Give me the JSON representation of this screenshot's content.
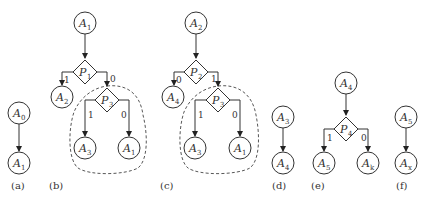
{
  "figure": {
    "panels": [
      {
        "caption": "(a)",
        "nodes": [
          {
            "id": "a_n1",
            "type": "action",
            "base": "A",
            "sub": "0"
          },
          {
            "id": "a_n2",
            "type": "action",
            "base": "A",
            "sub": "1"
          }
        ],
        "edges": [
          {
            "from": "a_n1",
            "to": "a_n2",
            "label": ""
          }
        ]
      },
      {
        "caption": "(b)",
        "nodes": [
          {
            "id": "b_n1",
            "type": "action",
            "base": "A",
            "sub": "1"
          },
          {
            "id": "b_p1",
            "type": "predicate",
            "base": "P",
            "sub": "1"
          },
          {
            "id": "b_n2",
            "type": "action",
            "base": "A",
            "sub": "2"
          },
          {
            "id": "b_p3",
            "type": "predicate",
            "base": "P",
            "sub": "3"
          },
          {
            "id": "b_n3",
            "type": "action",
            "base": "A",
            "sub": "3"
          },
          {
            "id": "b_n4",
            "type": "action",
            "base": "A",
            "sub": "1"
          }
        ],
        "edges": [
          {
            "from": "b_n1",
            "to": "b_p1",
            "label": ""
          },
          {
            "from": "b_p1",
            "to": "b_n2",
            "label": "1"
          },
          {
            "from": "b_p1",
            "to": "b_p3",
            "label": "0"
          },
          {
            "from": "b_p3",
            "to": "b_n3",
            "label": "1"
          },
          {
            "from": "b_p3",
            "to": "b_n4",
            "label": "0"
          }
        ],
        "highlight": "dashed region around P3 subtree"
      },
      {
        "caption": "(c)",
        "nodes": [
          {
            "id": "c_n1",
            "type": "action",
            "base": "A",
            "sub": "2"
          },
          {
            "id": "c_p2",
            "type": "predicate",
            "base": "P",
            "sub": "2"
          },
          {
            "id": "c_n2",
            "type": "action",
            "base": "A",
            "sub": "4"
          },
          {
            "id": "c_p3",
            "type": "predicate",
            "base": "P",
            "sub": "3"
          },
          {
            "id": "c_n3",
            "type": "action",
            "base": "A",
            "sub": "3"
          },
          {
            "id": "c_n4",
            "type": "action",
            "base": "A",
            "sub": "1"
          }
        ],
        "edges": [
          {
            "from": "c_n1",
            "to": "c_p2",
            "label": ""
          },
          {
            "from": "c_p2",
            "to": "c_n2",
            "label": "0"
          },
          {
            "from": "c_p2",
            "to": "c_p3",
            "label": "1"
          },
          {
            "from": "c_p3",
            "to": "c_n3",
            "label": "1"
          },
          {
            "from": "c_p3",
            "to": "c_n4",
            "label": "0"
          }
        ],
        "highlight": "dashed region around P3 subtree"
      },
      {
        "caption": "(d)",
        "nodes": [
          {
            "id": "d_n1",
            "type": "action",
            "base": "A",
            "sub": "3"
          },
          {
            "id": "d_n2",
            "type": "action",
            "base": "A",
            "sub": "4"
          }
        ],
        "edges": [
          {
            "from": "d_n1",
            "to": "d_n2",
            "label": ""
          }
        ]
      },
      {
        "caption": "(e)",
        "nodes": [
          {
            "id": "e_n1",
            "type": "action",
            "base": "A",
            "sub": "4"
          },
          {
            "id": "e_p4",
            "type": "predicate",
            "base": "P",
            "sub": "4"
          },
          {
            "id": "e_n2",
            "type": "action",
            "base": "A",
            "sub": "5"
          },
          {
            "id": "e_n3",
            "type": "action",
            "base": "A",
            "sub": "k"
          }
        ],
        "edges": [
          {
            "from": "e_n1",
            "to": "e_p4",
            "label": ""
          },
          {
            "from": "e_p4",
            "to": "e_n2",
            "label": "1"
          },
          {
            "from": "e_p4",
            "to": "e_n3",
            "label": "0"
          }
        ],
        "edge_labels": [
          "1",
          "0"
        ]
      },
      {
        "caption": "(f)",
        "nodes": [
          {
            "id": "f_n1",
            "type": "action",
            "base": "A",
            "sub": "5"
          },
          {
            "id": "f_n2",
            "type": "action",
            "base": "A",
            "sub": "x"
          }
        ],
        "edges": [
          {
            "from": "f_n1",
            "to": "f_n2",
            "label": ""
          }
        ]
      }
    ],
    "colors": {
      "stroke": "#333333",
      "background": "#ffffff"
    }
  }
}
